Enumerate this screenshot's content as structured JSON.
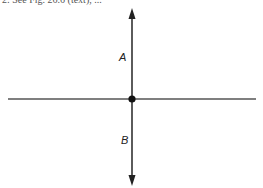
{
  "caption": "2:  See Fig. 26.6 (text), ...",
  "diagram": {
    "horizontal_line": {
      "x1": 8,
      "x2": 256,
      "y": 99
    },
    "vertical_axis": {
      "x": 132,
      "y_top": 8,
      "y_bottom": 186,
      "arrows": [
        "up",
        "down"
      ]
    },
    "center_point": {
      "x": 132,
      "y": 99
    },
    "labels": [
      {
        "id": "A",
        "text": "A",
        "position": "above center, left of vertical arrow"
      },
      {
        "id": "B",
        "text": "B",
        "position": "below center, left of vertical arrow"
      }
    ],
    "colors": {
      "line": "#333333",
      "dot": "#111111"
    }
  }
}
